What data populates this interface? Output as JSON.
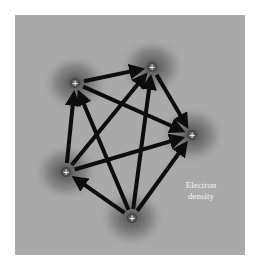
{
  "diagram": {
    "label": {
      "line1": "Electron",
      "line2": "density"
    },
    "nodes": [
      {
        "id": "top-left",
        "x": 75,
        "y": 83,
        "symbol": "+"
      },
      {
        "id": "top",
        "x": 152,
        "y": 67,
        "symbol": "+"
      },
      {
        "id": "right",
        "x": 192,
        "y": 135,
        "symbol": "+"
      },
      {
        "id": "left",
        "x": 66,
        "y": 172,
        "symbol": "+"
      },
      {
        "id": "bottom",
        "x": 132,
        "y": 218,
        "symbol": "+"
      }
    ],
    "edges": [
      {
        "from": "top-left",
        "to": "top"
      },
      {
        "from": "top-left",
        "to": "right"
      },
      {
        "from": "top",
        "to": "right"
      },
      {
        "from": "left",
        "to": "top-left"
      },
      {
        "from": "left",
        "to": "top"
      },
      {
        "from": "left",
        "to": "right"
      },
      {
        "from": "bottom",
        "to": "left"
      },
      {
        "from": "bottom",
        "to": "top-left"
      },
      {
        "from": "bottom",
        "to": "top"
      },
      {
        "from": "bottom",
        "to": "right"
      }
    ],
    "colors": {
      "background": "#a9a9a9",
      "cloud": "#4a4a4a",
      "arrow": "#0d0d0d",
      "label": "#f2f2f2"
    }
  }
}
